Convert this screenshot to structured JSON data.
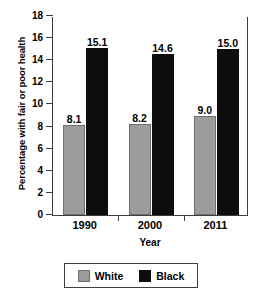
{
  "chart_data": {
    "type": "bar",
    "title": "",
    "xlabel": "Year",
    "ylabel": "Percentage with fair or poor health",
    "categories": [
      "1990",
      "2000",
      "2011"
    ],
    "series": [
      {
        "name": "White",
        "color": "#9c9c9c",
        "values": [
          8.1,
          8.2,
          9.0
        ],
        "labels": [
          "8.1",
          "8.2",
          "9.0"
        ]
      },
      {
        "name": "Black",
        "color": "#0d0d0d",
        "values": [
          15.1,
          14.6,
          15.0
        ],
        "labels": [
          "15.1",
          "14.6",
          "15.0"
        ]
      }
    ],
    "ylim": [
      0,
      18
    ],
    "ytick_step": 2,
    "yticks": [
      "0",
      "2",
      "4",
      "6",
      "8",
      "10",
      "12",
      "14",
      "16",
      "18"
    ],
    "grid": false,
    "legend_position": "bottom"
  }
}
